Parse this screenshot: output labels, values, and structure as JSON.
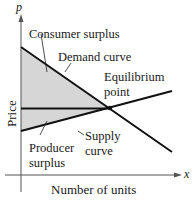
{
  "diagram": {
    "axes": {
      "y_variable": "p",
      "x_variable": "x",
      "y_label": "Price",
      "x_label": "Number of units"
    },
    "labels": {
      "consumer_surplus": "Consumer surplus",
      "demand_curve": "Demand curve",
      "equilibrium_1": "Equilibrium",
      "equilibrium_2": "point",
      "producer_surplus_1": "Producer",
      "producer_surplus_2": "surplus",
      "supply_curve_1": "Supply",
      "supply_curve_2": "curve"
    },
    "colors": {
      "line": "#111111",
      "fill": "#d4d4d4",
      "axis": "#555555"
    }
  }
}
